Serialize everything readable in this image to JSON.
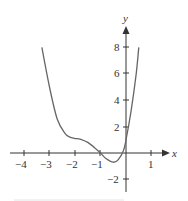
{
  "chart_data": {
    "type": "line",
    "title": "",
    "xlabel": "x",
    "ylabel": "y",
    "xlim": [
      -4.2,
      1.5
    ],
    "ylim": [
      -2.8,
      9.3
    ],
    "grid": false,
    "legend": null,
    "x_ticks": [
      -4,
      -3,
      -2,
      -1,
      1
    ],
    "x_tick_labels": [
      "−4",
      "−3",
      "−2",
      "−1",
      "1"
    ],
    "y_ticks": [
      -2,
      2,
      4,
      6,
      8
    ],
    "y_tick_labels": [
      "−2",
      "2",
      "4",
      "6",
      "8"
    ],
    "series": [
      {
        "name": "f(x)",
        "x": [
          -3.3,
          -3.0,
          -2.7,
          -2.4,
          -2.2,
          -2.0,
          -1.8,
          -1.5,
          -1.2,
          -1.0,
          -0.8,
          -0.5,
          -0.3,
          -0.1,
          0.0,
          0.2,
          0.4,
          0.5
        ],
        "y": [
          8.0,
          5.0,
          2.6,
          1.5,
          1.2,
          1.1,
          1.05,
          0.8,
          0.35,
          0.0,
          -0.4,
          -0.7,
          -0.5,
          0.2,
          1.0,
          3.2,
          6.0,
          8.0
        ]
      }
    ],
    "colors": {
      "axis": "#333333",
      "curve": "#666666",
      "text": "#333333"
    }
  },
  "labels": {
    "x_axis": "x",
    "y_axis": "y",
    "xt": [
      "−4",
      "−3",
      "−2",
      "−1",
      "1"
    ],
    "yt": [
      "8",
      "6",
      "4",
      "2",
      "−2"
    ]
  }
}
